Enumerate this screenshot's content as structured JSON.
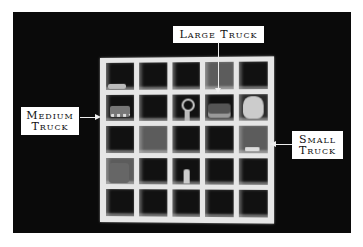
{
  "figure": {
    "labels": {
      "large_truck": "Large Truck",
      "medium_truck_line1": "Medium",
      "medium_truck_line2": "Truck",
      "small_truck_line1": "Small",
      "small_truck_line2": "Truck"
    },
    "colors": {
      "background": "#0a0a0a",
      "shelf": "#e6e6e6",
      "label_bg": "#ffffff",
      "label_text": "#111111"
    },
    "grid": {
      "rows": 5,
      "columns": 5
    }
  }
}
